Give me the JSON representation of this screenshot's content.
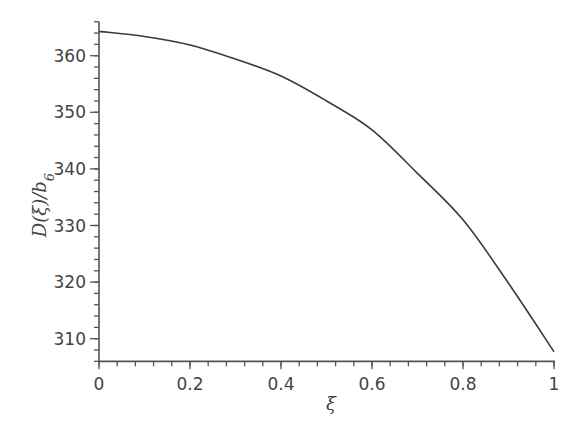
{
  "chart_data": {
    "type": "line",
    "title": "",
    "xlabel": "ξ",
    "ylabel": "D(ξ)/b₆",
    "ylabel_parts": {
      "main": "D(ξ)/b",
      "sub": "6"
    },
    "xlim": [
      0,
      1
    ],
    "ylim": [
      306,
      366
    ],
    "x_ticks": [
      0,
      0.2,
      0.4,
      0.6,
      0.8,
      1
    ],
    "x_tick_labels": [
      "0",
      "0.2",
      "0.4",
      "0.6",
      "0.8",
      "1"
    ],
    "x_minor_step": 0.04,
    "y_ticks": [
      310,
      320,
      330,
      340,
      350,
      360
    ],
    "y_tick_labels": [
      "310",
      "320",
      "330",
      "340",
      "350",
      "360"
    ],
    "y_minor_step": 2,
    "grid": false,
    "legend": null,
    "series": [
      {
        "name": "D(ξ)/b6",
        "x": [
          0,
          0.1,
          0.2,
          0.3,
          0.4,
          0.5,
          0.6,
          0.7,
          0.8,
          0.9,
          1.0
        ],
        "values": [
          364.3,
          363.4,
          361.9,
          359.4,
          356.4,
          352.0,
          346.9,
          339.2,
          331.0,
          319.8,
          307.7
        ]
      }
    ],
    "colors": {
      "line": "#3a3a3a",
      "axis": "#555555",
      "text": "#444444"
    }
  }
}
